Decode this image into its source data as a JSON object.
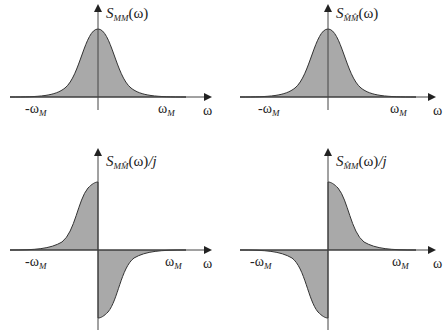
{
  "colors": {
    "fill": "#a9a9a9",
    "stroke": "#333333",
    "axis": "#444444",
    "background": "#ffffff"
  },
  "panels": [
    {
      "id": "top-left",
      "title": {
        "base": "S",
        "sub": "MM",
        "arg": "(ω)",
        "suffix": ""
      },
      "shape": "gaussian",
      "x_axis_label": "ω",
      "neg_tick": {
        "base": "-ω",
        "sub": "M"
      },
      "pos_tick": {
        "base": "ω",
        "sub": "M"
      }
    },
    {
      "id": "top-right",
      "title": {
        "base": "S",
        "sub": "M̂M̂",
        "arg": "(ω)",
        "suffix": ""
      },
      "shape": "gaussian",
      "x_axis_label": "ω",
      "neg_tick": {
        "base": "-ω",
        "sub": "M"
      },
      "pos_tick": {
        "base": "ω",
        "sub": "M"
      }
    },
    {
      "id": "bottom-left",
      "title": {
        "base": "S",
        "sub": "MM̂",
        "arg": "(ω)",
        "suffix": "/j"
      },
      "shape": "odd-positive-left",
      "x_axis_label": "ω",
      "neg_tick": {
        "base": "-ω",
        "sub": "M"
      },
      "pos_tick": {
        "base": "ω",
        "sub": "M"
      }
    },
    {
      "id": "bottom-right",
      "title": {
        "base": "S",
        "sub": "M̂M",
        "arg": "(ω)",
        "suffix": "/j"
      },
      "shape": "odd-positive-right",
      "x_axis_label": "ω",
      "neg_tick": {
        "base": "-ω",
        "sub": "M"
      },
      "pos_tick": {
        "base": "ω",
        "sub": "M"
      }
    }
  ]
}
